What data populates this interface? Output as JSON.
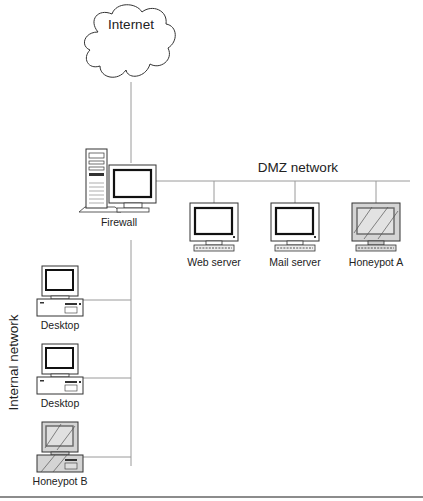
{
  "diagram": {
    "type": "network-topology",
    "cloud": {
      "label": "Internet"
    },
    "firewall": {
      "label": "Firewall"
    },
    "networks": {
      "dmz": {
        "label": "DMZ network"
      },
      "internal": {
        "label": "Internal network"
      }
    },
    "dmz_hosts": [
      {
        "label": "Web server",
        "type": "monitor"
      },
      {
        "label": "Mail server",
        "type": "monitor"
      },
      {
        "label": "Honeypot A",
        "type": "honeypot-monitor"
      }
    ],
    "internal_hosts": [
      {
        "label": "Desktop",
        "type": "desktop"
      },
      {
        "label": "Desktop",
        "type": "desktop"
      },
      {
        "label": "Honeypot B",
        "type": "honeypot-desktop"
      }
    ],
    "colors": {
      "line": "#9a9a9a",
      "outline": "#333333",
      "honeypot_fill": "#d4d4d4",
      "bottom_rule": "#8c8c8c"
    }
  }
}
